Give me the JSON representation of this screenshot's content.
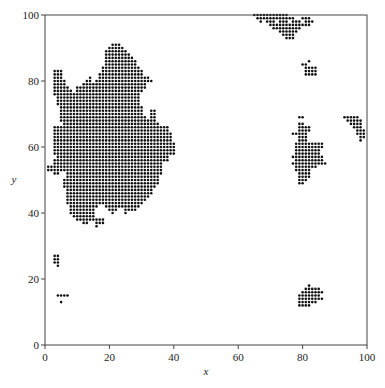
{
  "chart_data": {
    "type": "scatter",
    "title": "",
    "xlabel": "x",
    "ylabel": "y",
    "xlim": [
      0,
      100
    ],
    "ylim": [
      0,
      100
    ],
    "xticks": [
      0,
      20,
      40,
      60,
      80,
      100
    ],
    "yticks": [
      0,
      20,
      40,
      60,
      80,
      100
    ],
    "xtick_labels": [
      "0",
      "20",
      "40",
      "60",
      "80",
      "100"
    ],
    "ytick_labels": [
      "0",
      "20",
      "40",
      "60",
      "80",
      "100"
    ],
    "grid": false,
    "legend": null,
    "marker_color": "#111111",
    "marker_size": 1.3,
    "clusters": [
      {
        "name": "main-cluster",
        "rows": {
          "91": [
            [
              21,
              23
            ]
          ],
          "90": [
            [
              20,
              24
            ]
          ],
          "89": [
            [
              19,
              25
            ]
          ],
          "88": [
            [
              19,
              26
            ]
          ],
          "87": [
            [
              19,
              27
            ]
          ],
          "86": [
            [
              19,
              28
            ]
          ],
          "85": [
            [
              19,
              28
            ]
          ],
          "84": [
            [
              18,
              29
            ]
          ],
          "83": [
            [
              3,
              5
            ],
            [
              18,
              30
            ]
          ],
          "82": [
            [
              3,
              5
            ],
            [
              17,
              30
            ]
          ],
          "81": [
            [
              3,
              5
            ],
            [
              14,
              14
            ],
            [
              17,
              32
            ]
          ],
          "80": [
            [
              3,
              6
            ],
            [
              13,
              14
            ],
            [
              16,
              33
            ]
          ],
          "79": [
            [
              3,
              6
            ],
            [
              12,
              31
            ]
          ],
          "78": [
            [
              3,
              7
            ],
            [
              10,
              31
            ]
          ],
          "77": [
            [
              3,
              8
            ],
            [
              10,
              30
            ]
          ],
          "76": [
            [
              3,
              29
            ]
          ],
          "75": [
            [
              4,
              29
            ]
          ],
          "74": [
            [
              4,
              29
            ]
          ],
          "73": [
            [
              4,
              29
            ]
          ],
          "72": [
            [
              5,
              30
            ]
          ],
          "71": [
            [
              5,
              30
            ],
            [
              33,
              34
            ]
          ],
          "70": [
            [
              5,
              30
            ],
            [
              33,
              34
            ]
          ],
          "69": [
            [
              5,
              31
            ],
            [
              33,
              34
            ]
          ],
          "68": [
            [
              5,
              31
            ],
            [
              32,
              34
            ]
          ],
          "67": [
            [
              6,
              31
            ],
            [
              32,
              35
            ]
          ],
          "66": [
            [
              3,
              36
            ],
            [
              37,
              38
            ]
          ],
          "65": [
            [
              3,
              37
            ],
            [
              38,
              38
            ]
          ],
          "64": [
            [
              3,
              39
            ]
          ],
          "63": [
            [
              3,
              39
            ]
          ],
          "62": [
            [
              3,
              39
            ]
          ],
          "61": [
            [
              3,
              40
            ]
          ],
          "60": [
            [
              3,
              40
            ]
          ],
          "59": [
            [
              3,
              40
            ]
          ],
          "58": [
            [
              3,
              40
            ]
          ],
          "57": [
            [
              4,
              38
            ]
          ],
          "56": [
            [
              3,
              38
            ]
          ],
          "55": [
            [
              3,
              36
            ]
          ],
          "54": [
            [
              1,
              36
            ]
          ],
          "53": [
            [
              1,
              36
            ]
          ],
          "52": [
            [
              3,
              4
            ],
            [
              7,
              36
            ]
          ],
          "51": [
            [
              7,
              35
            ]
          ],
          "50": [
            [
              6,
              35
            ]
          ],
          "49": [
            [
              6,
              35
            ]
          ],
          "48": [
            [
              6,
              34
            ]
          ],
          "47": [
            [
              7,
              33
            ]
          ],
          "46": [
            [
              7,
              33
            ]
          ],
          "45": [
            [
              7,
              32
            ]
          ],
          "44": [
            [
              7,
              31
            ]
          ],
          "43": [
            [
              7,
              30
            ]
          ],
          "42": [
            [
              8,
              16
            ],
            [
              19,
              29
            ]
          ],
          "41": [
            [
              8,
              15
            ],
            [
              20,
              22
            ],
            [
              25,
              28
            ]
          ],
          "40": [
            [
              8,
              15
            ],
            [
              21,
              21
            ],
            [
              25,
              25
            ]
          ],
          "39": [
            [
              9,
              15
            ]
          ],
          "38": [
            [
              10,
              15
            ],
            [
              16,
              18
            ]
          ],
          "37": [
            [
              12,
              13
            ],
            [
              16,
              17
            ],
            [
              18,
              18
            ]
          ],
          "36": [
            [
              16,
              16
            ]
          ]
        }
      },
      {
        "name": "small-cluster-left-mid",
        "rows": {
          "27": [
            [
              3,
              4
            ]
          ],
          "26": [
            [
              3,
              4
            ]
          ],
          "25": [
            [
              3,
              4
            ]
          ],
          "24": [
            [
              4,
              4
            ]
          ]
        }
      },
      {
        "name": "small-cluster-left-low",
        "rows": {
          "15": [
            [
              4,
              7
            ]
          ],
          "13": [
            [
              5,
              5
            ]
          ]
        }
      },
      {
        "name": "top-cluster",
        "rows": {
          "100": [
            [
              65,
              75
            ]
          ],
          "99": [
            [
              66,
              77
            ],
            [
              80,
              82
            ]
          ],
          "98": [
            [
              67,
              67
            ],
            [
              69,
              71
            ],
            [
              73,
              75
            ],
            [
              77,
              79
            ],
            [
              81,
              83
            ]
          ],
          "97": [
            [
              70,
              77
            ],
            [
              78,
              82
            ]
          ],
          "96": [
            [
              71,
              79
            ]
          ],
          "95": [
            [
              73,
              78
            ]
          ],
          "94": [
            [
              74,
              77
            ]
          ],
          "93": [
            [
              75,
              77
            ]
          ]
        }
      },
      {
        "name": "small-cluster-upper-right",
        "rows": {
          "86": [
            [
              82,
              82
            ]
          ],
          "85": [
            [
              80,
              81
            ]
          ],
          "84": [
            [
              81,
              84
            ]
          ],
          "83": [
            [
              81,
              84
            ]
          ],
          "82": [
            [
              81,
              84
            ]
          ]
        }
      },
      {
        "name": "right-mid-cluster",
        "rows": {
          "69": [
            [
              79,
              80
            ]
          ],
          "67": [
            [
              79,
              80
            ]
          ],
          "66": [
            [
              79,
              82
            ]
          ],
          "65": [
            [
              79,
              82
            ]
          ],
          "64": [
            [
              77,
              81
            ]
          ],
          "63": [
            [
              79,
              81
            ]
          ],
          "62": [
            [
              79,
              81
            ]
          ],
          "61": [
            [
              78,
              86
            ]
          ],
          "60": [
            [
              78,
              86
            ]
          ],
          "59": [
            [
              78,
              85
            ]
          ],
          "58": [
            [
              78,
              85
            ]
          ],
          "57": [
            [
              77,
              86
            ]
          ],
          "56": [
            [
              78,
              86
            ]
          ],
          "55": [
            [
              77,
              87
            ]
          ],
          "54": [
            [
              78,
              84
            ]
          ],
          "53": [
            [
              78,
              82
            ]
          ],
          "52": [
            [
              79,
              82
            ]
          ],
          "51": [
            [
              79,
              82
            ]
          ],
          "50": [
            [
              79,
              81
            ]
          ],
          "49": [
            [
              79,
              80
            ]
          ]
        }
      },
      {
        "name": "far-right-cluster",
        "rows": {
          "69": [
            [
              93,
              97
            ]
          ],
          "68": [
            [
              94,
              98
            ]
          ],
          "67": [
            [
              95,
              98
            ]
          ],
          "66": [
            [
              96,
              98
            ]
          ],
          "65": [
            [
              97,
              99
            ]
          ],
          "64": [
            [
              97,
              99
            ]
          ],
          "63": [
            [
              98,
              99
            ]
          ],
          "62": [
            [
              98,
              98
            ]
          ]
        }
      },
      {
        "name": "bottom-right-cluster",
        "rows": {
          "18": [
            [
              82,
              82
            ]
          ],
          "17": [
            [
              81,
              85
            ]
          ],
          "16": [
            [
              80,
              86
            ]
          ],
          "15": [
            [
              79,
              85
            ]
          ],
          "14": [
            [
              79,
              86
            ]
          ],
          "13": [
            [
              79,
              84
            ]
          ],
          "12": [
            [
              79,
              82
            ]
          ]
        }
      }
    ]
  }
}
